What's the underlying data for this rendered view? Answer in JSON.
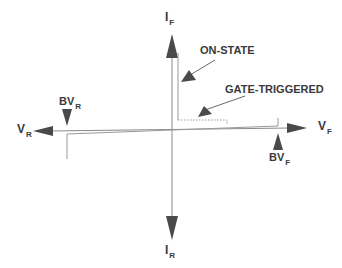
{
  "diagram": {
    "type": "thyristor-iv-characteristic",
    "axes": {
      "vertical_top": {
        "main": "I",
        "sub": "F"
      },
      "vertical_bottom": {
        "main": "I",
        "sub": "R"
      },
      "horizontal_left": {
        "main": "V",
        "sub": "R"
      },
      "horizontal_right": {
        "main": "V",
        "sub": "F"
      }
    },
    "markers": {
      "bv_r": {
        "main": "BV",
        "sub": "R"
      },
      "bv_f": {
        "main": "BV",
        "sub": "F"
      }
    },
    "annotations": {
      "on_state": "ON-STATE",
      "gate_triggered": "GATE-TRIGGERED"
    },
    "colors": {
      "arrow": "#4a4a4a",
      "axis": "#8a8a8a",
      "curve": "#9a9a9a",
      "text": "#3a3a3a"
    }
  }
}
